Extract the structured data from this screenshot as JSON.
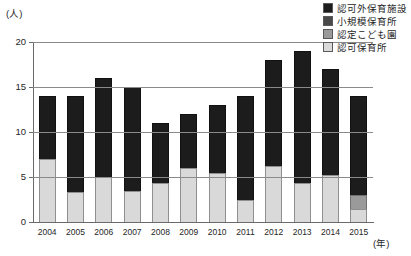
{
  "chart_data": {
    "type": "bar",
    "stacked": true,
    "title": "",
    "xlabel": "(年)",
    "ylabel": "(人)",
    "ylim": [
      0,
      20
    ],
    "yticks": [
      0,
      5,
      10,
      15,
      20
    ],
    "ytick_labels": [
      "0",
      "5",
      "10",
      "15",
      "20"
    ],
    "grid": true,
    "legend_position": "top-right",
    "categories": [
      "2004",
      "2005",
      "2006",
      "2007",
      "2008",
      "2009",
      "2010",
      "2011",
      "2012",
      "2013",
      "2014",
      "2015"
    ],
    "series": [
      {
        "name": "認可保育所",
        "color": "#d9d9d9",
        "values": [
          7,
          3.3,
          5,
          3.4,
          4.3,
          6,
          5.5,
          2.4,
          6.2,
          4.3,
          5.2,
          1.5
        ]
      },
      {
        "name": "認定こども園",
        "color": "#9a9a9a",
        "values": [
          0,
          0,
          0,
          0,
          0,
          0,
          0,
          0,
          0,
          0,
          0,
          1.5
        ]
      },
      {
        "name": "小規模保育所",
        "color": "#4a4a4a",
        "values": [
          0,
          0,
          0,
          0,
          0,
          0,
          0,
          0,
          0,
          0,
          0,
          0
        ]
      },
      {
        "name": "認可外保育施設",
        "color": "#1c1c1c",
        "values": [
          7,
          10.7,
          11,
          11.6,
          6.7,
          6,
          7.5,
          11.6,
          11.8,
          14.7,
          11.8,
          11
        ]
      }
    ],
    "totals": [
      14,
      14,
      16,
      15,
      11,
      12,
      13,
      14,
      18,
      19,
      17,
      14
    ]
  },
  "legend": {
    "items": [
      {
        "label": "認可外保育施設",
        "color": "#1c1c1c"
      },
      {
        "label": "小規模保育所",
        "color": "#4a4a4a"
      },
      {
        "label": "認定こども園",
        "color": "#9a9a9a"
      },
      {
        "label": "認可保育所",
        "color": "#d9d9d9"
      }
    ]
  },
  "axes": {
    "y_unit": "(人)",
    "x_unit": "(年)"
  }
}
